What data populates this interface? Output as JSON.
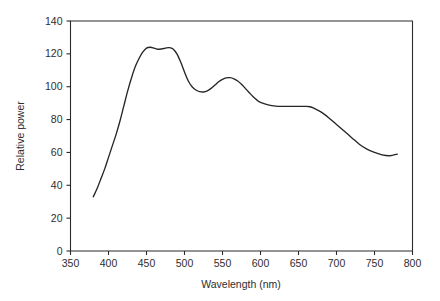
{
  "chart_data": {
    "type": "line",
    "title": "",
    "xlabel": "Wavelength (nm)",
    "ylabel": "Relative power",
    "xlim": [
      350,
      800
    ],
    "ylim": [
      0,
      140
    ],
    "grid": false,
    "legend": null,
    "xticks": [
      350,
      400,
      450,
      500,
      550,
      600,
      650,
      700,
      750,
      800
    ],
    "yticks": [
      0,
      20,
      40,
      60,
      80,
      100,
      120,
      140
    ],
    "xtick_labels": [
      "350",
      "400",
      "450",
      "500",
      "550",
      "600",
      "650",
      "700",
      "750",
      "800"
    ],
    "ytick_labels": [
      "0",
      "20",
      "40",
      "60",
      "80",
      "100",
      "120",
      "140"
    ],
    "series": [
      {
        "name": "Relative power",
        "color": "#262626",
        "x": [
          380,
          385,
          390,
          395,
          400,
          405,
          410,
          415,
          420,
          425,
          430,
          435,
          440,
          445,
          450,
          455,
          460,
          465,
          470,
          475,
          480,
          485,
          490,
          495,
          500,
          505,
          510,
          515,
          520,
          525,
          530,
          535,
          540,
          545,
          550,
          555,
          560,
          565,
          570,
          575,
          580,
          585,
          590,
          595,
          600,
          610,
          620,
          630,
          640,
          650,
          660,
          665,
          670,
          680,
          690,
          700,
          710,
          720,
          730,
          740,
          750,
          760,
          770,
          780
        ],
        "y": [
          33,
          38,
          44,
          50,
          57,
          64,
          71,
          79,
          88,
          97,
          105,
          112,
          117,
          121,
          123.5,
          124,
          123.5,
          122.8,
          123,
          123.5,
          123.8,
          123,
          120,
          115,
          109,
          103.5,
          100,
          98,
          97,
          96.8,
          97.5,
          99,
          101,
          103,
          104.5,
          105.4,
          105.5,
          104.8,
          103.5,
          101.5,
          99,
          96.5,
          94,
          92,
          90.5,
          89,
          88.2,
          88,
          88,
          88,
          88,
          87.8,
          87,
          84.5,
          81,
          77,
          73,
          69,
          65,
          62,
          60,
          58.5,
          58,
          59
        ]
      }
    ]
  },
  "axes": {
    "y_axis_title": "Relative power",
    "x_axis_title": "Wavelength (nm)"
  }
}
